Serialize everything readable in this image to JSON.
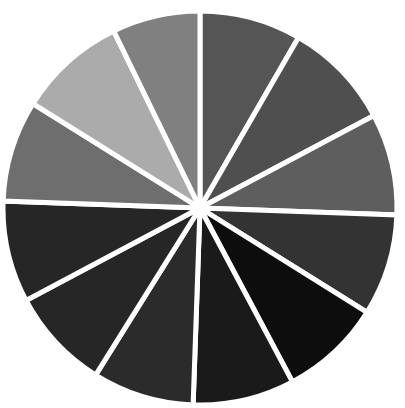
{
  "page": {
    "background_color": "#ffffff",
    "width": 405,
    "height": 408
  },
  "chart_data": {
    "type": "pie",
    "title": "",
    "subtitle": "",
    "xlabel": "",
    "ylabel": "",
    "legend_position": "none",
    "grid": false,
    "annotations": [],
    "center": {
      "x": 200,
      "y": 208
    },
    "radius": 197,
    "slice_count": 12,
    "start_angle_deg": -90,
    "direction": "clockwise",
    "divider_color": "#ffffff",
    "divider_width": 5,
    "categories": [
      "Slice 1",
      "Slice 2",
      "Slice 3",
      "Slice 4",
      "Slice 5",
      "Slice 6",
      "Slice 7",
      "Slice 8",
      "Slice 9",
      "Slice 10",
      "Slice 11",
      "Slice 12"
    ],
    "values": [
      8.33,
      8.33,
      8.33,
      8.33,
      8.33,
      8.33,
      8.33,
      8.33,
      8.33,
      8.33,
      8.33,
      8.33
    ],
    "angles_deg": [
      {
        "name": "Slice 1",
        "start": -90,
        "end": -60,
        "color": "#555555"
      },
      {
        "name": "Slice 2",
        "start": -60,
        "end": -28,
        "color": "#4f4f4f"
      },
      {
        "name": "Slice 3",
        "start": -28,
        "end": 2,
        "color": "#5e5e5e"
      },
      {
        "name": "Slice 4",
        "start": 2,
        "end": 32,
        "color": "#333333"
      },
      {
        "name": "Slice 5",
        "start": 32,
        "end": 62,
        "color": "#0d0d0d"
      },
      {
        "name": "Slice 6",
        "start": 62,
        "end": 92,
        "color": "#1a1a1a"
      },
      {
        "name": "Slice 7",
        "start": 92,
        "end": 122,
        "color": "#2b2b2b"
      },
      {
        "name": "Slice 8",
        "start": 122,
        "end": 152,
        "color": "#262626"
      },
      {
        "name": "Slice 9",
        "start": 152,
        "end": 182,
        "color": "#262626"
      },
      {
        "name": "Slice 10",
        "start": 182,
        "end": 212,
        "color": "#6e6e6e"
      },
      {
        "name": "Slice 11",
        "start": 212,
        "end": 244,
        "color": "#ababab"
      },
      {
        "name": "Slice 12",
        "start": 244,
        "end": 270,
        "color": "#808080"
      }
    ],
    "colors": [
      "#555555",
      "#4f4f4f",
      "#5e5e5e",
      "#333333",
      "#0d0d0d",
      "#1a1a1a",
      "#2b2b2b",
      "#262626",
      "#262626",
      "#6e6e6e",
      "#ababab",
      "#808080"
    ]
  }
}
